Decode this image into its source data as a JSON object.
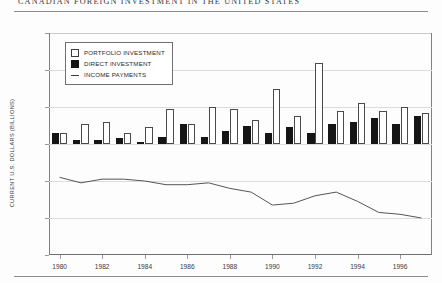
{
  "title": "CANADIAN FOREIGN INVESTMENT IN THE UNITED STATES",
  "legend": {
    "items": [
      {
        "label": "PORTFOLIO INVESTMENT",
        "marker": "open-square-swatch"
      },
      {
        "label": "DIRECT INVESTMENT",
        "marker": "filled-square-swatch"
      },
      {
        "label": "INCOME PAYMENTS",
        "marker": "line-swatch"
      }
    ]
  },
  "axes": {
    "ylabel": "CURRENT U.S. DOLLARS (BILLIONS)",
    "yticks": [
      60,
      40,
      20,
      0,
      -20,
      -40,
      -60
    ],
    "xticks": [
      "1980",
      "1982",
      "1984",
      "1986",
      "1988",
      "1990",
      "1992",
      "1994",
      "1996"
    ]
  },
  "chart_data": {
    "type": "bar",
    "title": "CANADIAN FOREIGN INVESTMENT IN THE UNITED STATES",
    "xlabel": "",
    "ylabel": "CURRENT U.S. DOLLARS (BILLIONS)",
    "ylim": [
      -60,
      60
    ],
    "xlim": [
      "1980",
      "1997"
    ],
    "grid": true,
    "legend_position": "upper-left-inside",
    "categories": [
      "1980",
      "1981",
      "1982",
      "1983",
      "1984",
      "1985",
      "1986",
      "1987",
      "1988",
      "1989",
      "1990",
      "1991",
      "1992",
      "1993",
      "1994",
      "1995",
      "1996",
      "1997"
    ],
    "series": [
      {
        "name": "PORTFOLIO INVESTMENT",
        "type": "bar",
        "color": "#ffffff",
        "values": [
          6,
          11,
          12,
          6,
          9,
          19,
          11,
          20,
          19,
          13,
          30,
          15,
          44,
          18,
          22,
          18,
          20,
          17
        ]
      },
      {
        "name": "DIRECT INVESTMENT",
        "type": "bar",
        "color": "#151515",
        "values": [
          6,
          2,
          2,
          3,
          1,
          4,
          11,
          4,
          7,
          10,
          6,
          9,
          6,
          11,
          12,
          14,
          11,
          15
        ]
      },
      {
        "name": "INCOME PAYMENTS",
        "type": "line",
        "color": "#555555",
        "values": [
          -18,
          -21,
          -19,
          -19,
          -20,
          -22,
          -22,
          -21,
          -24,
          -26,
          -33,
          -32,
          -28,
          -26,
          -31,
          -37,
          -38,
          -40
        ]
      }
    ]
  }
}
